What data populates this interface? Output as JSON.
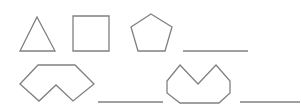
{
  "colors": {
    "stroke": "#808080",
    "background": "#ffffff"
  },
  "shapes": [
    {
      "name": "triangle",
      "points": "37,17 55,51 20,51"
    },
    {
      "name": "square",
      "points": "73,16 109,16 109,51 73,51"
    },
    {
      "name": "pentagon",
      "points": "151,14 172,27 165,51 138,51 131,27"
    },
    {
      "name": "notched-hexagon-shape",
      "points": "38,65 75,65 94,84 73,101 56,85 39,101 20,84"
    },
    {
      "name": "notched-octagon-shape",
      "points": "180,65 198,84 216,65 230,81 230,93 219,103 180,103 167,93 167,81"
    }
  ],
  "answer_blanks": [
    {
      "x1": 183,
      "x2": 248,
      "y": 51
    },
    {
      "x1": 98,
      "x2": 163,
      "y": 102
    },
    {
      "x1": 240,
      "x2": 300,
      "y": 102
    }
  ]
}
